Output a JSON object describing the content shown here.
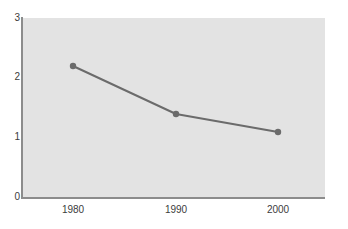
{
  "chart_data": {
    "type": "line",
    "title": "",
    "subtitle": "",
    "xlabel": "",
    "ylabel": "",
    "x": [
      1980,
      1990,
      2000
    ],
    "categories": [
      "1980",
      "1990",
      "2000"
    ],
    "series": [
      {
        "name": "",
        "values": [
          2.2,
          1.4,
          1.1
        ]
      }
    ],
    "xlim": [
      1975,
      2005
    ],
    "ylim": [
      0,
      3
    ],
    "yticks": [
      0,
      1,
      2,
      3
    ],
    "ytick_labels": [
      "0",
      "1",
      "2",
      "3"
    ],
    "xticks": [
      1980,
      1990,
      2000
    ],
    "xtick_labels": [
      "1980",
      "1990",
      "2000"
    ],
    "grid": false,
    "legend": false,
    "legend_position": "none",
    "markers": "circle",
    "colors": {
      "line": "#6b6b6b",
      "marker": "#6b6b6b",
      "plot_background": "#e3e3e3",
      "figure_background": "#ffffff",
      "axis": "#8c8c8c",
      "tick_label": "#3c3c3c"
    },
    "annotations": []
  },
  "axes": {
    "y": {
      "ticks": [
        {
          "label": "3",
          "value": 3
        },
        {
          "label": "2",
          "value": 2
        },
        {
          "label": "1",
          "value": 1
        },
        {
          "label": "0",
          "value": 0
        }
      ]
    },
    "x": {
      "ticks": [
        {
          "label": "1980",
          "value": 1980
        },
        {
          "label": "1990",
          "value": 1990
        },
        {
          "label": "2000",
          "value": 2000
        }
      ]
    }
  },
  "points": [
    {
      "x_label": "1980",
      "y_value": "2.2"
    },
    {
      "x_label": "1990",
      "y_value": "1.4"
    },
    {
      "x_label": "2000",
      "y_value": "1.1"
    }
  ]
}
